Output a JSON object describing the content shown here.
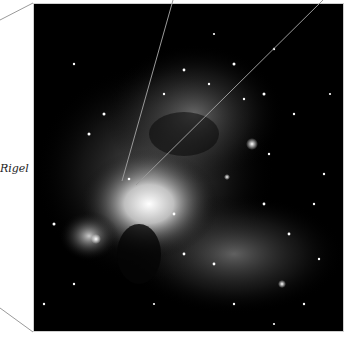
{
  "figure": {
    "labels": [
      {
        "text": "Rigel"
      }
    ],
    "colors": {
      "background": "#ffffff",
      "sky": "#000000",
      "pointer_lines": "#9a9a9a"
    }
  }
}
